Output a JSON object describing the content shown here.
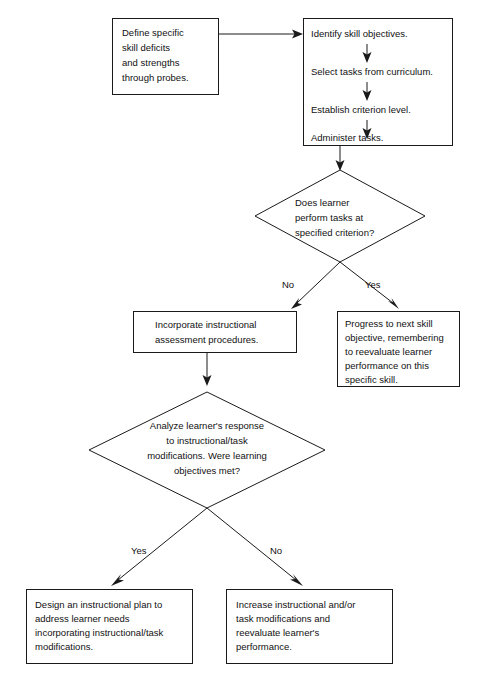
{
  "diagram": {
    "colors": {
      "background": "#ffffff",
      "stroke": "#1a1a1a",
      "text": "#111111"
    },
    "nodes": {
      "define_probes": {
        "type": "process",
        "lines": [
          "Define specific",
          "skill deficits",
          "and strengths",
          "through probes."
        ]
      },
      "task_sequence": {
        "type": "process-group",
        "steps": [
          "Identify skill objectives.",
          "Select tasks from curriculum.",
          "Establish criterion level.",
          "Administer tasks."
        ]
      },
      "criterion_decision": {
        "type": "decision",
        "lines": [
          "Does learner",
          "perform tasks at",
          "specified criterion?"
        ]
      },
      "incorporate_assessment": {
        "type": "process",
        "lines": [
          "Incorporate instructional",
          "assessment procedures."
        ]
      },
      "progress_next_skill": {
        "type": "process",
        "lines": [
          "Progress to next skill",
          "objective, remembering",
          "to reevaluate learner",
          "performance on this",
          "specific skill."
        ]
      },
      "analyze_response_decision": {
        "type": "decision",
        "lines": [
          "Analyze learner's response",
          "to instructional/task",
          "modifications. Were learning",
          "objectives met?"
        ]
      },
      "design_plan": {
        "type": "process",
        "lines": [
          "Design an instructional plan to",
          "address learner needs",
          "incorporating instructional/task",
          "modifications."
        ]
      },
      "increase_modifications": {
        "type": "process",
        "lines": [
          "Increase instructional and/or",
          "task modifications and",
          "reevaluate learner's",
          "performance."
        ]
      }
    },
    "branch_labels": {
      "criterion_no": "No",
      "criterion_yes": "Yes",
      "analyze_yes": "Yes",
      "analyze_no": "No"
    }
  }
}
